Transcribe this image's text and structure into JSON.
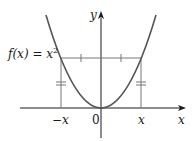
{
  "diagram": {
    "type": "even-function-graph",
    "function_label": "f(x) = x²",
    "function_label_parts": {
      "prefix": "f(x) = x",
      "exponent": "2"
    },
    "axis_labels": {
      "x": "x",
      "y": "y"
    },
    "tick_labels": {
      "negative_x": "−x",
      "origin": "0",
      "positive_x": "x"
    },
    "colors": {
      "curve": "#555555",
      "axes": "#1a1a1a",
      "guides": "#777777",
      "text": "#1a1a1a"
    }
  }
}
